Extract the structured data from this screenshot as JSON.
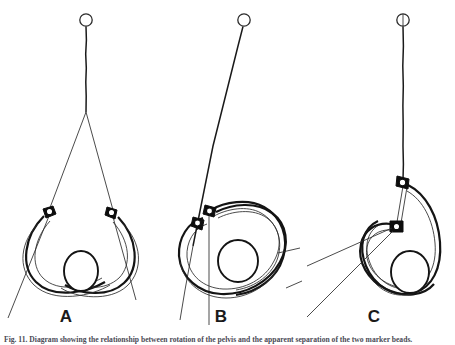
{
  "figure": {
    "type": "line-drawing-diagram",
    "background_color": "#ffffff",
    "ink_color": "#1a1a1a",
    "caption": "Fig. 11. Diagram showing the relationship between rotation of the pelvis and the apparent separation of the two marker beads.",
    "panels": [
      {
        "id": "A",
        "label": "A",
        "label_x": 66,
        "label_y": 322,
        "description": "Pelvic ring viewed frontally, suspension line vertical, two marker beads widely separated near the iliac crests, oval sacral body at the lower centre.",
        "rotation_state": "0 degrees - neutral frontal view",
        "suspension": {
          "pivot_x": 86,
          "pivot_y": 20,
          "fork_y": 112,
          "orientation": "vertical"
        },
        "markers": [
          {
            "name": "bead-left",
            "x": 49,
            "y": 212
          },
          {
            "name": "bead-right",
            "x": 113,
            "y": 213
          }
        ],
        "marker_separation": "maximum"
      },
      {
        "id": "B",
        "label": "B",
        "label_x": 221,
        "label_y": 322,
        "description": "Pelvic ring rotated obliquely, suspension line tilted, the two marker beads appear close together on the left side of the ring.",
        "rotation_state": "intermediate oblique rotation",
        "suspension": {
          "pivot_x": 244,
          "pivot_y": 20,
          "fork_y": 214,
          "orientation": "tilted"
        },
        "markers": [
          {
            "name": "bead-upper",
            "x": 211,
            "y": 212
          },
          {
            "name": "bead-lower",
            "x": 199,
            "y": 223
          }
        ],
        "marker_separation": "reduced"
      },
      {
        "id": "C",
        "label": "C",
        "label_x": 374,
        "label_y": 322,
        "description": "Pelvic ring rotated furthest, suspension line vertical again, the two marker beads now superimposed vertically and joined by a narrow strut.",
        "rotation_state": "maximum rotation - beads vertically aligned",
        "suspension": {
          "pivot_x": 403,
          "pivot_y": 20,
          "fork_y": 182,
          "orientation": "vertical"
        },
        "markers": [
          {
            "name": "bead-upper",
            "x": 404,
            "y": 182
          },
          {
            "name": "bead-lower",
            "x": 397,
            "y": 227
          }
        ],
        "marker_separation": "minimum - vertical overlap"
      }
    ],
    "legend_elements": [
      {
        "name": "suspension-line",
        "label": "suspension / plumb line"
      },
      {
        "name": "marker-bead",
        "label": "radio-opaque marker bead"
      },
      {
        "name": "pelvic-ring",
        "label": "pelvic ring outline"
      },
      {
        "name": "sacral-body",
        "label": "central oval body"
      },
      {
        "name": "projection-ray",
        "label": "projection ray"
      }
    ]
  }
}
